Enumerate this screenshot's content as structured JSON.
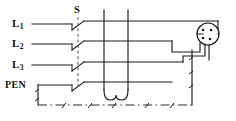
{
  "diagram": {
    "background_color": "#ffffff",
    "line_color": "#1a1a1a",
    "labels": {
      "line1": {
        "base": "L",
        "sub": "1"
      },
      "line2": {
        "base": "L",
        "sub": "2"
      },
      "line3": {
        "base": "L",
        "sub": "3"
      },
      "pen": "PEN",
      "switch": "S"
    },
    "components": [
      {
        "name": "four-pole-switch",
        "label": "S",
        "poles": 4,
        "ganged": true,
        "state": "open"
      },
      {
        "name": "socket-outlet",
        "type": "socket",
        "pins": 4,
        "position": "upper-right"
      },
      {
        "name": "load-loop",
        "type": "u-loop",
        "conductors": 2,
        "position": "center-bottom"
      },
      {
        "name": "earth-boundary",
        "type": "dash-dot-rail",
        "position": "bottom"
      }
    ],
    "conductors": [
      {
        "name": "L1",
        "y": 24
      },
      {
        "name": "L2",
        "y": 44
      },
      {
        "name": "L3",
        "y": 65
      },
      {
        "name": "PEN",
        "y": 85
      }
    ]
  }
}
